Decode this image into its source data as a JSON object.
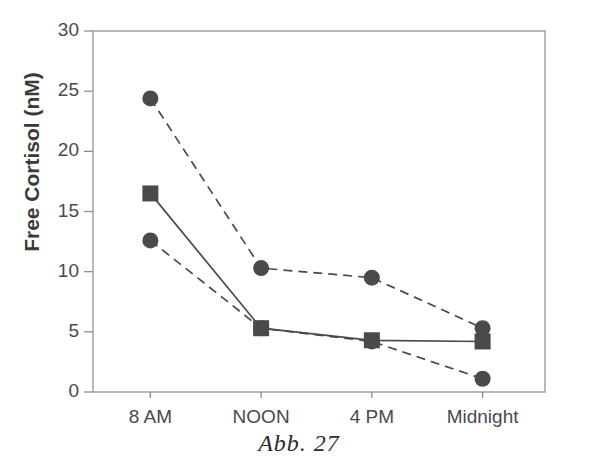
{
  "caption": "Abb. 27",
  "chart_data": {
    "type": "line",
    "title": "",
    "subtitle": "",
    "xlabel": "",
    "ylabel": "Free Cortisol (nM)",
    "categories": [
      "8 AM",
      "NOON",
      "4 PM",
      "Midnight"
    ],
    "x": [
      0,
      1,
      2,
      3
    ],
    "ylim": [
      0,
      30
    ],
    "yticks": [
      0,
      5,
      10,
      15,
      20,
      25,
      30
    ],
    "ytick_labels": [
      "0",
      "5",
      "10",
      "15",
      "20",
      "25",
      "30"
    ],
    "grid": false,
    "legend": "none",
    "series": [
      {
        "name": "upper-dashed-circle",
        "marker": "circle",
        "linestyle": "dashed",
        "color": "#4a4a4a",
        "values": [
          24.4,
          10.3,
          9.5,
          5.3
        ]
      },
      {
        "name": "solid-square",
        "marker": "square",
        "linestyle": "solid",
        "color": "#4a4a4a",
        "values": [
          16.5,
          5.3,
          4.3,
          4.2
        ]
      },
      {
        "name": "lower-dashed-circle",
        "marker": "circle",
        "linestyle": "dashed",
        "color": "#4a4a4a",
        "values": [
          12.6,
          5.3,
          4.2,
          1.1
        ]
      }
    ]
  },
  "axis": {
    "frame_color": "#8d8d8d",
    "tick_color": "#8d8d8d"
  }
}
